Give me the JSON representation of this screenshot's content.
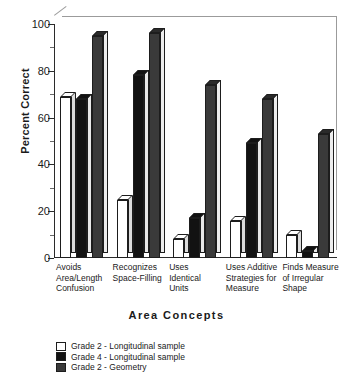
{
  "chart_data": {
    "type": "bar",
    "title": "",
    "xlabel": "Area Concepts",
    "ylabel": "Percent Correct",
    "ylim": [
      0,
      100
    ],
    "yticks": [
      0,
      20,
      40,
      60,
      80,
      100
    ],
    "ytick_labels": [
      "0",
      "20",
      "40",
      "60",
      "80",
      "100"
    ],
    "grid": false,
    "legend_position": "bottom-left",
    "categories": [
      "Avoids\nArea/Length\nConfusion",
      "Recognizes\nSpace-Filling",
      "Uses\nIdentical\nUnits",
      "Uses Additive\nStrategies for\nMeasure",
      "Finds Measure\nof Irregular\nShape"
    ],
    "series": [
      {
        "name": "Grade 2 - Longitudinal sample",
        "color": "#ffffff",
        "values": [
          69,
          25,
          8,
          16,
          10
        ]
      },
      {
        "name": "Grade 4 - Longitudinal sample",
        "color": "#121212",
        "values": [
          68,
          78,
          17,
          49,
          3
        ]
      },
      {
        "name": "Grade 2 - Geometry",
        "color": "#3a3a3a",
        "values": [
          95,
          96,
          74,
          68,
          53
        ]
      }
    ]
  }
}
